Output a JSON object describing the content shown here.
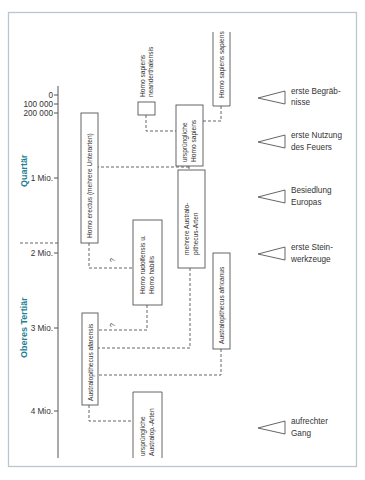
{
  "colors": {
    "frame": "#b9c6cc",
    "era_label": "#1f7f96",
    "lines": "#555555",
    "text": "#333333"
  },
  "time_axis": {
    "ticks": [
      {
        "label": "0",
        "y": 95
      },
      {
        "label": "100 000",
        "y": 104
      },
      {
        "label": "200 000",
        "y": 113
      },
      {
        "label": "1 Mio.",
        "y": 178
      },
      {
        "label": "2 Mio.",
        "y": 253
      },
      {
        "label": "3 Mio.",
        "y": 328
      },
      {
        "label": "4 Mio.",
        "y": 411
      }
    ]
  },
  "eras": [
    {
      "label": "Quartär"
    },
    {
      "label": "Oberes Tertiär"
    }
  ],
  "species": {
    "homo_sapiens_sapiens": "Homo sapiens sapiens",
    "neanderthalensis_line1": "Homo sapiens",
    "neanderthalensis_line2": "neanderthalensis",
    "early_sapiens_line1": "ursprüngliche",
    "early_sapiens_line2": "Homo sapiens",
    "homo_erectus": "Homo erectus (mehrere Unterarten)",
    "multi_australo_line1": "mehrere Australo-",
    "multi_australo_line2": "pithecus-Arten",
    "rudolfensis_line1": "Homo rudolfensis u.",
    "rudolfensis_line2": "Homo habilis",
    "africanus": "Australopithecus africanus",
    "afarensis": "Australopithecus afarensis",
    "early_australo_line1": "ursprüngliche",
    "early_australo_line2": "Australop.-Arten"
  },
  "uncertainty_marks": [
    "?",
    "?"
  ],
  "events": [
    {
      "line1": "erste Begräb-",
      "line2": "nisse"
    },
    {
      "line1": "erste Nutzung",
      "line2": "des Feuers"
    },
    {
      "line1": "Besiedlung",
      "line2": "Europas"
    },
    {
      "line1": "erste Stein-",
      "line2": "werkzeuge"
    },
    {
      "line1": "aufrechter",
      "line2": "Gang"
    }
  ]
}
